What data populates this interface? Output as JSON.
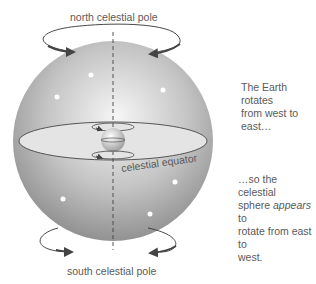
{
  "labels": {
    "north_pole": "north celestial pole",
    "south_pole": "south celestial pole",
    "equator": "celestial equator"
  },
  "captions": {
    "earth_rotation": [
      "The Earth rotates",
      "from west to east…"
    ],
    "sphere_rotation": {
      "line1": "…so the celestial",
      "line2_pre": "sphere ",
      "line2_em": "appears",
      "line2_post": " to",
      "line3": "rotate from east to",
      "line4": "west."
    }
  },
  "colors": {
    "sphere_light": "#f2f2f2",
    "sphere_dark": "#8e8e8e",
    "equator_plane": "#e2e2e2",
    "arrow": "#444444",
    "text": "#5a5a5a"
  }
}
